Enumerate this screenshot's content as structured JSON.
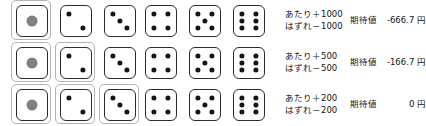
{
  "diagram": {
    "title_visible": false,
    "columns": 6,
    "rows": 3,
    "die_faces": [
      1,
      2,
      3,
      4,
      5,
      6
    ],
    "pip_color": "#151515",
    "one_face_pip_color": "#808080",
    "selection_ring_color": "#b3b3b3",
    "die_border_color": "#2b2b2b",
    "rows_data": [
      {
        "row_index": 1,
        "selected_faces": [
          1
        ],
        "win_label": "あたり＋1000",
        "lose_label": "はずれ－1000",
        "ev_label": "期待値",
        "ev_value": "-666.7 円",
        "dice": [
          {
            "face": 1,
            "selected": true
          },
          {
            "face": 2,
            "selected": false
          },
          {
            "face": 3,
            "selected": false
          },
          {
            "face": 4,
            "selected": false
          },
          {
            "face": 5,
            "selected": false
          },
          {
            "face": 6,
            "selected": false
          }
        ]
      },
      {
        "row_index": 2,
        "selected_faces": [
          1,
          2
        ],
        "win_label": "あたり＋500",
        "lose_label": "はずれ－500",
        "ev_label": "期待値",
        "ev_value": "-166.7 円",
        "dice": [
          {
            "face": 1,
            "selected": true
          },
          {
            "face": 2,
            "selected": true
          },
          {
            "face": 3,
            "selected": false
          },
          {
            "face": 4,
            "selected": false
          },
          {
            "face": 5,
            "selected": false
          },
          {
            "face": 6,
            "selected": false
          }
        ]
      },
      {
        "row_index": 3,
        "selected_faces": [
          1,
          2,
          3
        ],
        "win_label": "あたり＋200",
        "lose_label": "はずれ－200",
        "ev_label": "期待値",
        "ev_value": "0 円",
        "dice": [
          {
            "face": 1,
            "selected": true
          },
          {
            "face": 2,
            "selected": true
          },
          {
            "face": 3,
            "selected": true
          },
          {
            "face": 4,
            "selected": false
          },
          {
            "face": 5,
            "selected": false
          },
          {
            "face": 6,
            "selected": false
          }
        ]
      }
    ]
  }
}
